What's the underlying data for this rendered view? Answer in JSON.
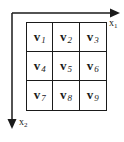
{
  "diagram": {
    "axes": {
      "x1": {
        "base": "x",
        "subscript": "1",
        "direction": "right"
      },
      "x2": {
        "base": "x",
        "subscript": "2",
        "direction": "down"
      }
    },
    "grid": {
      "rows": 3,
      "cols": 3,
      "cells": [
        {
          "base": "v",
          "subscript": "1"
        },
        {
          "base": "v",
          "subscript": "2"
        },
        {
          "base": "v",
          "subscript": "3"
        },
        {
          "base": "v",
          "subscript": "4"
        },
        {
          "base": "v",
          "subscript": "5"
        },
        {
          "base": "v",
          "subscript": "6"
        },
        {
          "base": "v",
          "subscript": "7"
        },
        {
          "base": "v",
          "subscript": "8"
        },
        {
          "base": "v",
          "subscript": "9"
        }
      ]
    },
    "colors": {
      "ink": "#1a1a1a",
      "background": "#ffffff"
    }
  }
}
